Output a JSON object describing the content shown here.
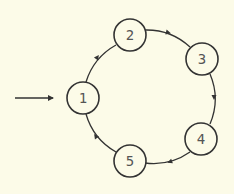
{
  "diagram": {
    "type": "state-cycle",
    "background": "#fcfbe8",
    "stroke_color": "#333333",
    "nodes": [
      {
        "id": "1",
        "label": "1",
        "cx": 83,
        "cy": 98
      },
      {
        "id": "2",
        "label": "2",
        "cx": 130,
        "cy": 35
      },
      {
        "id": "3",
        "label": "3",
        "cx": 202,
        "cy": 59
      },
      {
        "id": "4",
        "label": "4",
        "cx": 201,
        "cy": 139
      },
      {
        "id": "5",
        "label": "5",
        "cx": 130,
        "cy": 161
      }
    ],
    "edges": [
      {
        "from": "1",
        "to": "2"
      },
      {
        "from": "2",
        "to": "3"
      },
      {
        "from": "3",
        "to": "4"
      },
      {
        "from": "4",
        "to": "5"
      },
      {
        "from": "5",
        "to": "1"
      }
    ],
    "entry_arrow": {
      "to": "1"
    }
  }
}
